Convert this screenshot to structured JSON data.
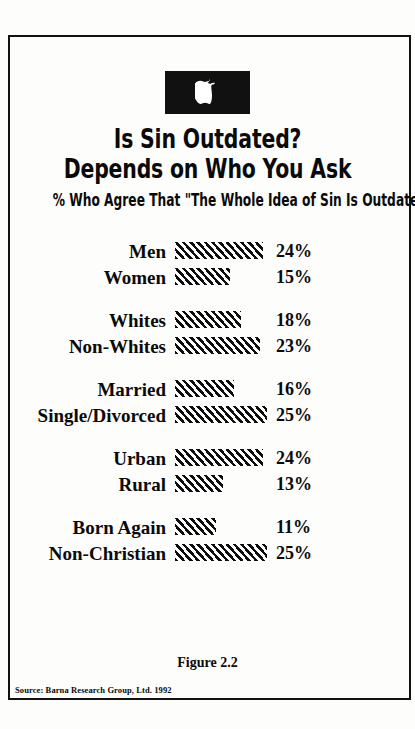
{
  "figure": {
    "logo_icon": "bitten-apple-icon",
    "title_lines": [
      "Is Sin Outdated?",
      "Depends on Who You Ask"
    ],
    "subtitle": "% Who Agree That \"The Whole Idea of Sin Is Outdated\"",
    "caption": "Figure 2.2",
    "source": "Source: Barna Research Group, Ltd. 1992",
    "colors": {
      "ink": "#0a0a0a",
      "paper": "#fdfdfc",
      "bar_hatch": "#0d0d0d",
      "bar_background": "#ffffff"
    }
  },
  "chart_data": {
    "type": "bar",
    "title": "Is Sin Outdated? Depends on Who You Ask",
    "subtitle": "% Who Agree That \"The Whole Idea of Sin Is Outdated\"",
    "xlabel": "",
    "ylabel": "",
    "orientation": "horizontal",
    "grid": false,
    "legend": "none",
    "xlim": [
      0,
      25
    ],
    "value_suffix": "%",
    "categories": [
      "Men",
      "Women",
      "Whites",
      "Non-Whites",
      "Married",
      "Single/Divorced",
      "Urban",
      "Rural",
      "Born Again",
      "Non-Christian"
    ],
    "values": [
      24,
      15,
      18,
      23,
      16,
      25,
      24,
      13,
      11,
      25
    ],
    "groups": [
      {
        "name": "gender",
        "rows": [
          {
            "label": "Men",
            "value": 24,
            "value_label": "24%"
          },
          {
            "label": "Women",
            "value": 15,
            "value_label": "15%"
          }
        ]
      },
      {
        "name": "ethnicity",
        "rows": [
          {
            "label": "Whites",
            "value": 18,
            "value_label": "18%"
          },
          {
            "label": "Non-Whites",
            "value": 23,
            "value_label": "23%"
          }
        ]
      },
      {
        "name": "marital-status",
        "rows": [
          {
            "label": "Married",
            "value": 16,
            "value_label": "16%"
          },
          {
            "label": "Single/Divorced",
            "value": 25,
            "value_label": "25%"
          }
        ]
      },
      {
        "name": "residence",
        "rows": [
          {
            "label": "Urban",
            "value": 24,
            "value_label": "24%"
          },
          {
            "label": "Rural",
            "value": 13,
            "value_label": "13%"
          }
        ]
      },
      {
        "name": "faith",
        "rows": [
          {
            "label": "Born Again",
            "value": 11,
            "value_label": "11%"
          },
          {
            "label": "Non-Christian",
            "value": 25,
            "value_label": "25%"
          }
        ]
      }
    ]
  }
}
